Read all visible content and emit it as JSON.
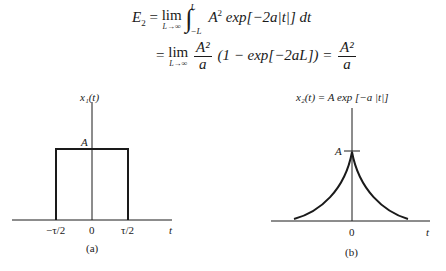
{
  "equations": {
    "line1": {
      "lhs": "E",
      "lhs_sub": "2",
      "eq": "=",
      "lim": "lim",
      "lim_sub": "L→∞",
      "int_upper": "L",
      "int_lower": "−L",
      "integrand": "A",
      "integrand_sup": "2",
      "integrand_rest": " exp[−2a|t|] dt"
    },
    "line2": {
      "eq": "=",
      "lim": "lim",
      "lim_sub": "L→∞",
      "frac1_num": "A²",
      "frac1_den": "a",
      "middle": "(1 − exp[−2aL]) =",
      "frac2_num": "A²",
      "frac2_den": "a"
    }
  },
  "figures": [
    {
      "id": "a",
      "y_label": "x₁(t)",
      "amplitude_label": "A",
      "x_ticks": [
        "−τ/2",
        "0",
        "τ/2"
      ],
      "x_label": "t",
      "caption": "(a)",
      "shape": "rectangular pulse"
    },
    {
      "id": "b",
      "y_label": "x₂(t) = A exp [−a |t|]",
      "amplitude_label": "A",
      "x_ticks": [
        "0"
      ],
      "x_label": "t",
      "caption": "(b)",
      "shape": "two-sided exponential"
    }
  ]
}
